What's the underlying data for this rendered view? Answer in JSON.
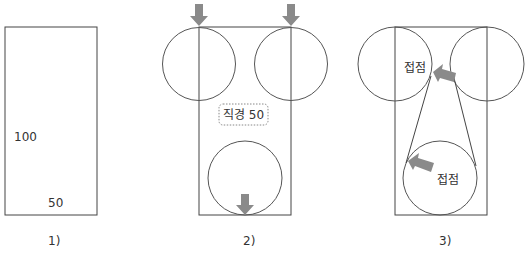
{
  "panels": [
    {
      "caption": "1)",
      "labels": {
        "height": "100",
        "width": "50"
      }
    },
    {
      "caption": "2)",
      "callout": "직경 50"
    },
    {
      "caption": "3)",
      "labels": {
        "contact_top": "접점",
        "contact_bottom": "접점"
      }
    }
  ],
  "colors": {
    "line": "#444444",
    "arrow": "#8a8a8a",
    "text": "#333333",
    "callout_border": "#888888"
  }
}
